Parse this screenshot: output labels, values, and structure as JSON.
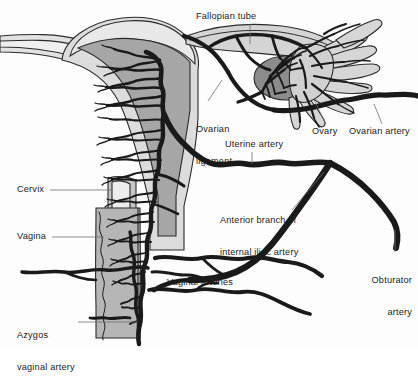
{
  "figure": {
    "type": "anatomical-illustration",
    "style": "grayscale line drawing",
    "background_color": "#fdfdfd",
    "vessel_color": "#1a1a1a",
    "leader_line_color": "#6e6e6e",
    "text_color": "#1b1b1b"
  },
  "labels": [
    {
      "id": "fallopian-tube",
      "text": "Fallopian tube",
      "lines": [
        "Fallopian tube"
      ],
      "x": 196,
      "y": 11,
      "align": "left"
    },
    {
      "id": "ovarian-ligament",
      "text": "Ovarian ligament",
      "lines": [
        "Ovarian",
        "ligament"
      ],
      "x": 196,
      "y": 103,
      "align": "left"
    },
    {
      "id": "ovary",
      "text": "Ovary",
      "lines": [
        "Ovary"
      ],
      "x": 312,
      "y": 126,
      "align": "left"
    },
    {
      "id": "ovarian-artery",
      "text": "Ovarian artery",
      "lines": [
        "Ovarian artery"
      ],
      "x": 349,
      "y": 126,
      "align": "left"
    },
    {
      "id": "uterine-artery",
      "text": "Uterine artery",
      "lines": [
        "Uterine artery"
      ],
      "x": 225,
      "y": 139,
      "align": "left"
    },
    {
      "id": "anterior-branch",
      "text": "Anterior branch of internal iliac artery",
      "lines": [
        "Anterior branch of",
        "internal iliac artery"
      ],
      "x": 220,
      "y": 194,
      "align": "left"
    },
    {
      "id": "cervix",
      "text": "Cervix",
      "lines": [
        "Cervix"
      ],
      "x": 17,
      "y": 184,
      "align": "left"
    },
    {
      "id": "vagina",
      "text": "Vagina",
      "lines": [
        "Vagina"
      ],
      "x": 17,
      "y": 231,
      "align": "left"
    },
    {
      "id": "vaginal-arteries",
      "text": "Vaginal arteries",
      "lines": [
        "Vaginal arteries"
      ],
      "x": 167,
      "y": 277,
      "align": "left"
    },
    {
      "id": "azygos-vaginal-artery",
      "text": "Azygos vaginal artery",
      "lines": [
        "Azygos",
        "vaginal artery"
      ],
      "x": 17,
      "y": 309,
      "align": "left"
    },
    {
      "id": "obturator-artery",
      "text": "Obturator artery",
      "lines": [
        "Obturator",
        "artery"
      ],
      "x": 368,
      "y": 254,
      "align": "right"
    }
  ],
  "structures": [
    {
      "id": "uterus-body",
      "name": "Uterus (body and fundus)",
      "fill": "#d8d8d8"
    },
    {
      "id": "endometrial-cavity",
      "name": "Uterine cavity / endometrium",
      "fill": "#a8a8a8"
    },
    {
      "id": "fallopian-tube-lumen",
      "name": "Fallopian tube",
      "fill": "#d0d0d0"
    },
    {
      "id": "ovary-body",
      "name": "Ovary",
      "fill": "#8e8e8e"
    },
    {
      "id": "fimbriae",
      "name": "Fimbriae of fallopian tube",
      "fill": "#d6d6d6"
    },
    {
      "id": "vaginal-canal",
      "name": "Vagina",
      "fill": "#b4b4b4"
    },
    {
      "id": "cervix-body",
      "name": "Cervix",
      "fill": "#c4c4c4"
    }
  ],
  "vessels": [
    {
      "id": "uterine-artery-trunk",
      "name": "Uterine artery"
    },
    {
      "id": "ovarian-artery-trunk",
      "name": "Ovarian artery"
    },
    {
      "id": "internal-iliac-branch",
      "name": "Anterior branch of internal iliac artery"
    },
    {
      "id": "obturator-artery-trunk",
      "name": "Obturator artery"
    },
    {
      "id": "vaginal-arteries-group",
      "name": "Vaginal arteries"
    },
    {
      "id": "azygos-artery-trunk",
      "name": "Azygos vaginal artery"
    },
    {
      "id": "arcuate-network",
      "name": "Arcuate and radial arteries of the uterus"
    },
    {
      "id": "ovarian-arcade",
      "name": "Ovarian arterial arcade"
    }
  ]
}
